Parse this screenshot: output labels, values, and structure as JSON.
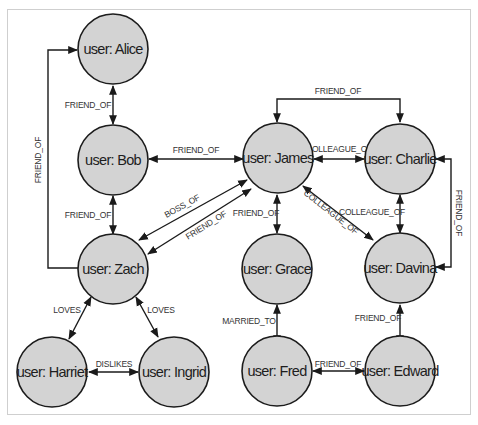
{
  "diagram": {
    "type": "graph",
    "colors": {
      "node_fill": "#d3d3d3",
      "node_stroke": "#1c1c1c",
      "edge": "#1a1a1a",
      "label": "#333333"
    },
    "nodes": [
      {
        "id": "alice",
        "label": "user: Alice"
      },
      {
        "id": "bob",
        "label": "user: Bob"
      },
      {
        "id": "zach",
        "label": "user: Zach"
      },
      {
        "id": "harriet",
        "label": "user: Harriet"
      },
      {
        "id": "ingrid",
        "label": "user: Ingrid"
      },
      {
        "id": "james",
        "label": "user: James"
      },
      {
        "id": "charlie",
        "label": "user: Charlie"
      },
      {
        "id": "grace",
        "label": "user: Grace"
      },
      {
        "id": "davina",
        "label": "user: Davina"
      },
      {
        "id": "fred",
        "label": "user: Fred"
      },
      {
        "id": "edward",
        "label": "user: Edward"
      }
    ],
    "edges": [
      {
        "from": "alice",
        "to": "bob",
        "label": "FRIEND_OF"
      },
      {
        "from": "bob",
        "to": "zach",
        "label": "FRIEND_OF"
      },
      {
        "from": "zach",
        "to": "alice",
        "label": "FRIEND_OF"
      },
      {
        "from": "bob",
        "to": "james",
        "label": "FRIEND_OF"
      },
      {
        "from": "zach",
        "to": "james",
        "label": "BOSS_OF"
      },
      {
        "from": "james",
        "to": "zach",
        "label": "FRIEND_OF"
      },
      {
        "from": "zach",
        "to": "harriet",
        "label": "LOVES"
      },
      {
        "from": "zach",
        "to": "ingrid",
        "label": "LOVES"
      },
      {
        "from": "harriet",
        "to": "ingrid",
        "label": "DISLIKES"
      },
      {
        "from": "james",
        "to": "charlie",
        "label": "FRIEND_OF"
      },
      {
        "from": "james",
        "to": "charlie",
        "label": "COLLEAGUE_OF"
      },
      {
        "from": "james",
        "to": "grace",
        "label": "FRIEND_OF"
      },
      {
        "from": "james",
        "to": "davina",
        "label": "COLLEAGUE_OF"
      },
      {
        "from": "charlie",
        "to": "davina",
        "label": "COLLEAGUE_OF"
      },
      {
        "from": "charlie",
        "to": "davina",
        "label": "FRIEND_OF"
      },
      {
        "from": "grace",
        "to": "fred",
        "label": "MARRIED_TO"
      },
      {
        "from": "davina",
        "to": "edward",
        "label": "FRIEND_OF"
      },
      {
        "from": "fred",
        "to": "edward",
        "label": "FRIEND_OF"
      }
    ]
  }
}
